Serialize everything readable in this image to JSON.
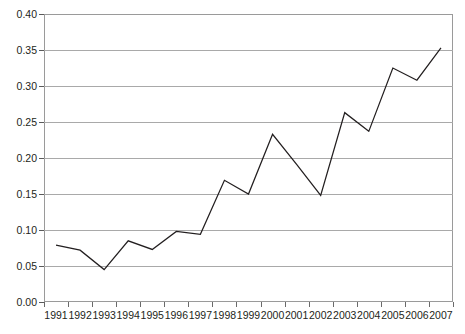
{
  "chart_data": {
    "type": "line",
    "title": "",
    "xlabel": "",
    "ylabel": "",
    "categories": [
      "1991",
      "1992",
      "1993",
      "1994",
      "1995",
      "1996",
      "1997",
      "1998",
      "1999",
      "2000",
      "2001",
      "2002",
      "2003",
      "2004",
      "2005",
      "2006",
      "2007"
    ],
    "values": [
      0.079,
      0.072,
      0.045,
      0.085,
      0.073,
      0.098,
      0.094,
      0.169,
      0.15,
      0.233,
      0.191,
      0.148,
      0.263,
      0.237,
      0.325,
      0.308,
      0.353
    ],
    "series": [
      {
        "name": "series-1",
        "values": [
          0.079,
          0.072,
          0.045,
          0.085,
          0.073,
          0.098,
          0.094,
          0.169,
          0.15,
          0.233,
          0.191,
          0.148,
          0.263,
          0.237,
          0.325,
          0.308,
          0.353
        ]
      }
    ],
    "ylim": [
      0.0,
      0.4
    ],
    "yticks": [
      0.0,
      0.05,
      0.1,
      0.15,
      0.2,
      0.25,
      0.3,
      0.35,
      0.4
    ],
    "ytick_labels": [
      "0.00",
      "0.05",
      "0.10",
      "0.15",
      "0.20",
      "0.25",
      "0.30",
      "0.35",
      "0.40"
    ],
    "grid": true,
    "legend": false,
    "legend_position": "none",
    "line_color": "#231f20",
    "grid_color": "#a9a9a9",
    "axis_color": "#9a9a9a",
    "background": "#ffffff"
  }
}
